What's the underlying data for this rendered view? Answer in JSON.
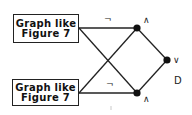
{
  "diagram": {
    "boxes": [
      {
        "id": "top-box",
        "line1": "Graph like",
        "line2": "Figure 7"
      },
      {
        "id": "bottom-box",
        "line1": "Graph like",
        "line2": "Figure 7"
      }
    ],
    "negation_labels": {
      "top": "¬",
      "bottom": "¬"
    },
    "nodes": {
      "top_and": {
        "label": "∧"
      },
      "bottom_and": {
        "label": "∧"
      },
      "or": {
        "label": "∨"
      }
    },
    "graph_label": "D",
    "colors": {
      "stroke": "#222222",
      "node": "#111111",
      "background": "#ffffff"
    }
  }
}
